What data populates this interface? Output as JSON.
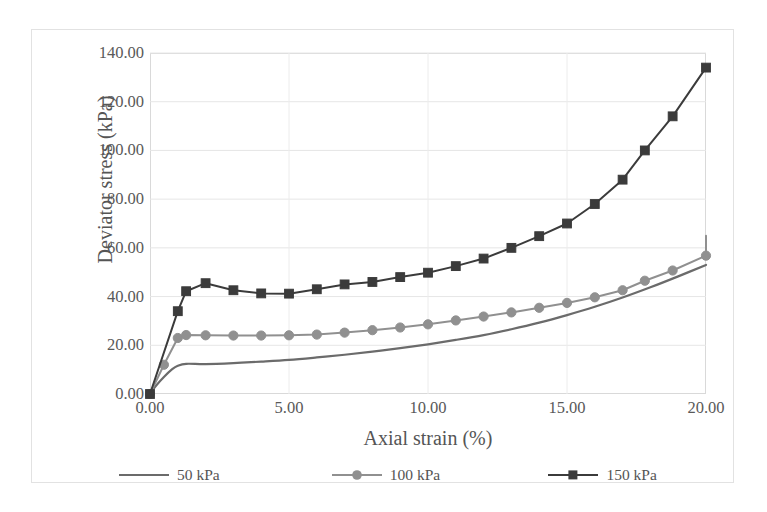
{
  "chart_data": {
    "type": "line",
    "title": "",
    "xlabel": "Axial strain (%)",
    "ylabel": "Deviator stress (kPa)",
    "xlim": [
      0,
      20
    ],
    "ylim": [
      0,
      140
    ],
    "xticks": [
      "0.00",
      "5.00",
      "10.00",
      "15.00",
      "20.00"
    ],
    "xtick_values": [
      0,
      5,
      10,
      15,
      20
    ],
    "yticks": [
      "0.00",
      "20.00",
      "40.00",
      "60.00",
      "80.00",
      "100.00",
      "120.00",
      "140.00"
    ],
    "ytick_values": [
      0,
      20,
      40,
      60,
      80,
      100,
      120,
      140
    ],
    "grid": true,
    "grid_axis": "y",
    "legend_position": "bottom",
    "series": [
      {
        "name": "50 kPa",
        "label": "50 kPa",
        "color": "#6b6b6b",
        "marker": "none",
        "x": [
          0.0,
          0.2,
          0.5,
          0.8,
          1.0,
          1.3,
          2.0,
          3.0,
          4.0,
          5.0,
          6.0,
          7.0,
          8.0,
          9.0,
          10.0,
          11.0,
          12.0,
          13.0,
          14.0,
          15.0,
          16.0,
          17.0,
          18.0,
          19.0,
          20.0
        ],
        "y": [
          0.0,
          3.2,
          7.0,
          10.2,
          11.6,
          12.4,
          12.3,
          12.7,
          13.3,
          14.0,
          15.0,
          16.1,
          17.4,
          18.8,
          20.4,
          22.2,
          24.2,
          26.6,
          29.3,
          32.4,
          35.8,
          39.6,
          43.8,
          48.3,
          53.0
        ]
      },
      {
        "name": "100 kPa",
        "label": "100 kPa",
        "color": "#909090",
        "marker": "circle",
        "x": [
          0.0,
          0.5,
          1.0,
          1.3,
          2.0,
          3.0,
          4.0,
          5.0,
          6.0,
          7.0,
          8.0,
          9.0,
          10.0,
          11.0,
          12.0,
          13.0,
          14.0,
          15.0,
          16.0,
          17.0,
          17.8,
          18.8,
          20.0
        ],
        "y": [
          0.0,
          12.0,
          23.0,
          24.2,
          24.1,
          24.0,
          24.0,
          24.1,
          24.4,
          25.2,
          26.2,
          27.3,
          28.6,
          30.2,
          31.8,
          33.5,
          35.4,
          37.4,
          39.7,
          42.6,
          46.5,
          50.7,
          56.8
        ],
        "y_end": 65.0
      },
      {
        "name": "150 kPa",
        "label": "150 kPa",
        "color": "#3b3b3b",
        "marker": "square",
        "x": [
          0.0,
          1.0,
          1.3,
          2.0,
          3.0,
          4.0,
          5.0,
          6.0,
          7.0,
          8.0,
          9.0,
          10.0,
          11.0,
          12.0,
          13.0,
          14.0,
          15.0,
          16.0,
          17.0,
          17.8,
          18.8,
          20.0
        ],
        "y": [
          0.0,
          34.0,
          42.2,
          45.5,
          42.6,
          41.3,
          41.2,
          43.0,
          45.0,
          46.0,
          48.0,
          49.8,
          52.5,
          55.6,
          60.0,
          64.8,
          70.0,
          78.0,
          88.0,
          100.0,
          114.0,
          134.0
        ]
      }
    ]
  }
}
